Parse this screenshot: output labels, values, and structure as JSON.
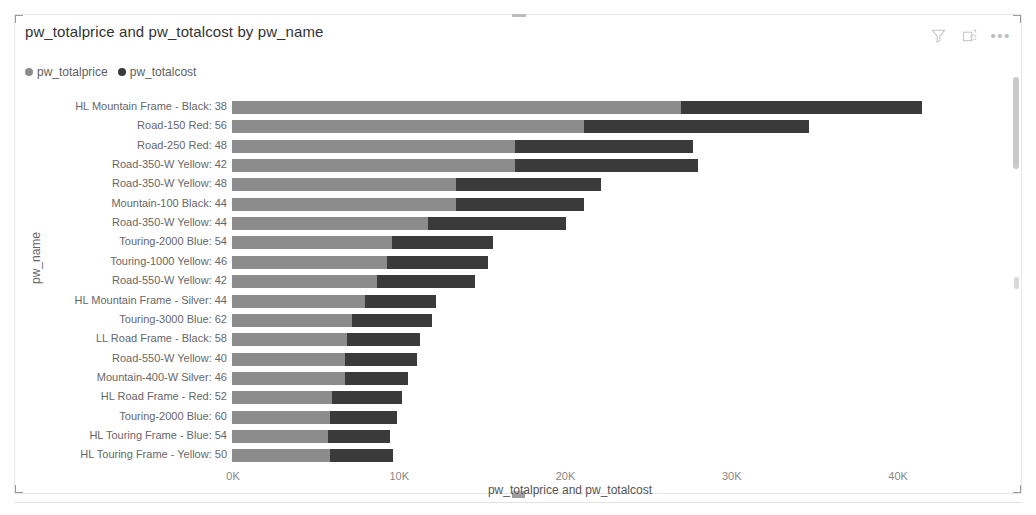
{
  "visual": {
    "title": "pw_totalprice and pw_totalcost by pw_name",
    "header_icons": [
      {
        "name": "filter-icon",
        "label": "Filters"
      },
      {
        "name": "focus-mode-icon",
        "label": "Focus mode"
      },
      {
        "name": "more-options-icon",
        "label": "More options"
      }
    ]
  },
  "legend": {
    "position": "top-left",
    "items": [
      {
        "label": "pw_totalprice",
        "color": "#8c8c8c"
      },
      {
        "label": "pw_totalcost",
        "color": "#3a3a3a"
      }
    ]
  },
  "colors": {
    "series_price": "#8c8c8c",
    "series_cost": "#3a3a3a",
    "axis_text": "#888888",
    "category_text": "#676767",
    "title_text": "#333333"
  },
  "chart_data": {
    "type": "bar",
    "orientation": "horizontal",
    "stacked": true,
    "title": "pw_totalprice and pw_totalcost by pw_name",
    "xlabel": "pw_totalprice and pw_totalcost",
    "ylabel": "pw_name",
    "xlim": [
      0,
      41500
    ],
    "xticks": [
      0,
      10000,
      20000,
      30000,
      40000
    ],
    "xticklabels": [
      "0K",
      "10K",
      "20K",
      "30K",
      "40K"
    ],
    "grid": false,
    "legend": [
      "pw_totalprice",
      "pw_totalcost"
    ],
    "categories": [
      "HL Mountain Frame - Black: 38",
      "Road-150 Red: 56",
      "Road-250 Red: 48",
      "Road-350-W Yellow: 42",
      "Road-350-W Yellow: 48",
      "Mountain-100 Black: 44",
      "Road-350-W Yellow: 44",
      "Touring-2000 Blue: 54",
      "Touring-1000 Yellow: 46",
      "Road-550-W Yellow: 42",
      "HL Mountain Frame - Silver: 44",
      "Touring-3000 Blue: 62",
      "LL Road Frame - Black: 58",
      "Road-550-W Yellow: 40",
      "Mountain-400-W Silver: 46",
      "HL Road Frame - Red: 52",
      "Touring-2000 Blue: 60",
      "HL Touring Frame - Blue: 54",
      "HL Touring Frame - Yellow: 50"
    ],
    "series": [
      {
        "name": "pw_totalprice",
        "color": "#8c8c8c",
        "values": [
          27000,
          21200,
          17000,
          17000,
          13500,
          13500,
          11800,
          9600,
          9300,
          8700,
          8000,
          7200,
          6900,
          6800,
          6800,
          6000,
          5900,
          5800,
          5900
        ]
      },
      {
        "name": "pw_totalcost",
        "color": "#3a3a3a",
        "values": [
          14500,
          13500,
          10700,
          11000,
          8700,
          7700,
          8300,
          6100,
          6100,
          5900,
          4300,
          4800,
          4400,
          4300,
          3800,
          4200,
          4000,
          3700,
          3800
        ]
      }
    ],
    "totals": [
      41500,
      34700,
      27700,
      28000,
      22200,
      21200,
      20100,
      15700,
      15400,
      14600,
      12300,
      12000,
      11300,
      11100,
      10600,
      10200,
      9900,
      9500,
      9700
    ]
  },
  "scrollbar": {
    "vertical_visible": true
  }
}
